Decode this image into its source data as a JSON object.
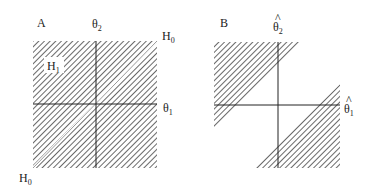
{
  "panels": {
    "a": {
      "label": "A",
      "y_axis": {
        "symbol": "θ",
        "sub": "2"
      },
      "x_axis": {
        "symbol": "θ",
        "sub": "1"
      },
      "diagonal_top": {
        "symbol": "H",
        "sub": "0"
      },
      "diagonal_bottom": {
        "symbol": "H",
        "sub": "0"
      },
      "region": {
        "symbol": "H",
        "sub": "1"
      }
    },
    "b": {
      "label": "B",
      "y_axis": {
        "symbol": "θ",
        "sub": "2",
        "hat": "^"
      },
      "x_axis": {
        "symbol": "θ",
        "sub": "1",
        "hat": "^"
      }
    }
  },
  "colors": {
    "ink": "#222222",
    "hatch": "#444444",
    "background": "#ffffff"
  }
}
